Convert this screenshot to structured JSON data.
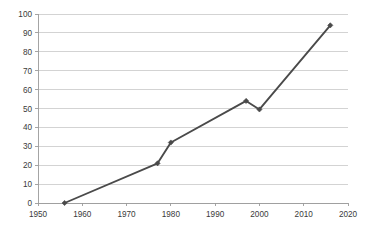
{
  "chart_data": {
    "type": "line",
    "title": "",
    "subtitle": "",
    "xlabel": "",
    "ylabel": "",
    "xlim": [
      1950,
      2020
    ],
    "ylim": [
      0,
      100
    ],
    "grid": "horizontal",
    "legend": "none",
    "x_ticks": [
      1950,
      1960,
      1970,
      1980,
      1990,
      2000,
      2010,
      2020
    ],
    "x_tick_labels": [
      "1950",
      "1960",
      "1970",
      "1980",
      "1990",
      "2000",
      "2010",
      "2020"
    ],
    "y_ticks": [
      0,
      10,
      20,
      30,
      40,
      50,
      60,
      70,
      80,
      90,
      100
    ],
    "y_tick_labels": [
      "0",
      "10",
      "20",
      "30",
      "40",
      "50",
      "60",
      "70",
      "80",
      "90",
      "100"
    ],
    "series": [
      {
        "name": "series-1",
        "marker": "diamond",
        "color": "#4a4a4a",
        "x": [
          1956,
          1977,
          1980,
          1997,
          2000,
          2016
        ],
        "values": [
          0,
          21,
          32,
          54,
          49.5,
          94
        ],
        "points": [
          {
            "x": 1956,
            "y": 0
          },
          {
            "x": 1977,
            "y": 21
          },
          {
            "x": 1980,
            "y": 32
          },
          {
            "x": 1997,
            "y": 54
          },
          {
            "x": 2000,
            "y": 49.5
          },
          {
            "x": 2016,
            "y": 94
          }
        ]
      }
    ],
    "colors": {
      "line": "#4a4a4a",
      "marker": "#4a4a4a",
      "gridline": "#c8c8c8",
      "axis": "#9a9a9a",
      "tick_text": "#3a3a3a",
      "background": "#ffffff"
    },
    "plot_area": {
      "left": 38,
      "top": 14,
      "right": 348,
      "bottom": 203
    }
  }
}
